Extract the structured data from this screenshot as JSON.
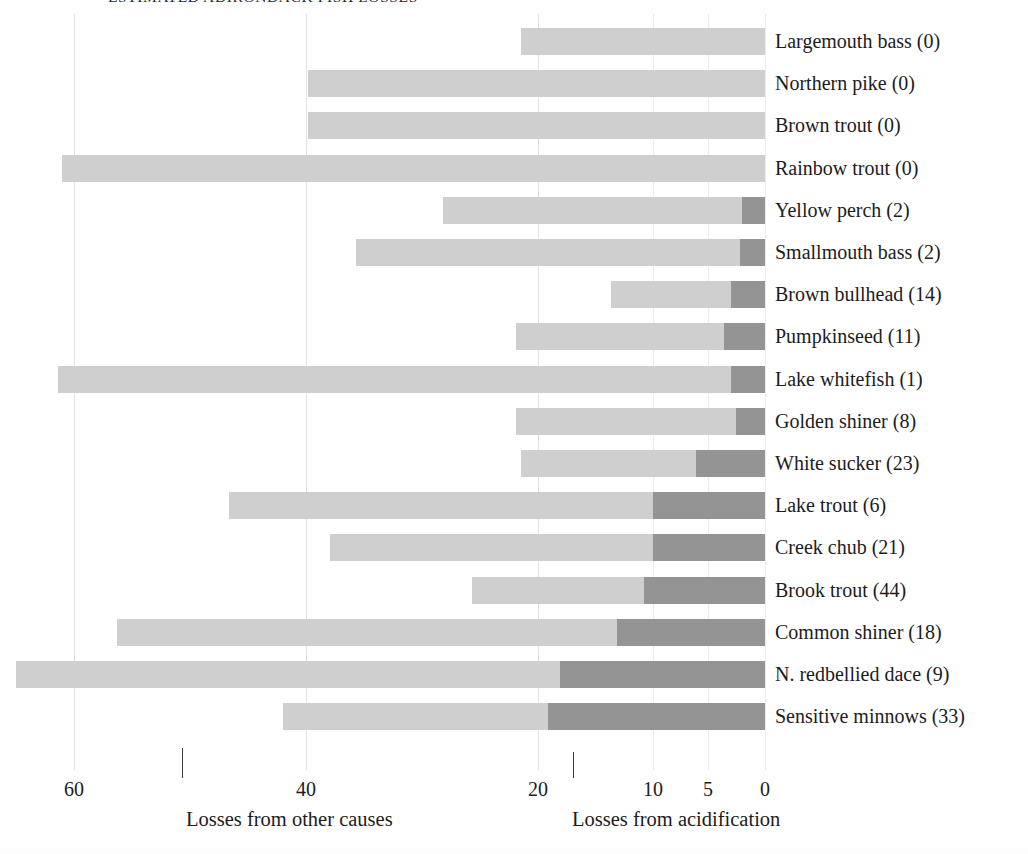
{
  "chart": {
    "title": "ESTIMATED ADIRONDACK FISH LOSSES",
    "axis": {
      "left_caption": "Losses from other causes",
      "right_caption": "Losses from acidification",
      "ticks": [
        "60",
        "40",
        "20",
        "10",
        "5",
        "0"
      ]
    }
  },
  "chart_data": {
    "type": "bar",
    "title": "ESTIMATED ADIRONDACK FISH LOSSES",
    "orientation": "horizontal",
    "stacked": true,
    "xlabel": "Number of ponds with lost populations",
    "ylabel": "",
    "grid": true,
    "legend_position": "below-axis",
    "x_axis_note": "Axis runs right-to-left from 0 at the right edge to 60 at the left; scale is non-linear (expanded near 0).",
    "axis_ticks": [
      60,
      40,
      20,
      10,
      5,
      0
    ],
    "series": [
      {
        "name": "Losses from acidification",
        "color": "#949494"
      },
      {
        "name": "Losses from other causes",
        "color": "#cfcfcf"
      }
    ],
    "categories": [
      "Largemouth bass",
      "Northern pike",
      "Brown trout",
      "Rainbow trout",
      "Yellow perch",
      "Smallmouth bass",
      "Brown bullhead",
      "Pumpkinseed",
      "Lake whitefish",
      "Golden shiner",
      "White sucker",
      "Lake trout",
      "Creek chub",
      "Brook trout",
      "Common shiner",
      "N. redbellied dace",
      "Sensitive minnows"
    ],
    "acidification_values": [
      0,
      0,
      0,
      0,
      2,
      2,
      14,
      11,
      1,
      8,
      23,
      6,
      21,
      44,
      18,
      9,
      33
    ],
    "rows": [
      {
        "label": "Largemouth bass (0)",
        "name": "Largemouth bass",
        "acidification": 0,
        "total_start_px": 521,
        "split_px": 765
      },
      {
        "label": "Northern pike (0)",
        "name": "Northern pike",
        "acidification": 0,
        "total_start_px": 308,
        "split_px": 765
      },
      {
        "label": "Brown trout (0)",
        "name": "Brown trout",
        "acidification": 0,
        "total_start_px": 308,
        "split_px": 765
      },
      {
        "label": "Rainbow trout (0)",
        "name": "Rainbow trout",
        "acidification": 0,
        "total_start_px": 62,
        "split_px": 765
      },
      {
        "label": "Yellow perch (2)",
        "name": "Yellow perch",
        "acidification": 2,
        "total_start_px": 443,
        "split_px": 742
      },
      {
        "label": "Smallmouth bass (2)",
        "name": "Smallmouth bass",
        "acidification": 2,
        "total_start_px": 356,
        "split_px": 740
      },
      {
        "label": "Brown bullhead (14)",
        "name": "Brown bullhead",
        "acidification": 14,
        "total_start_px": 611,
        "split_px": 731
      },
      {
        "label": "Pumpkinseed (11)",
        "name": "Pumpkinseed",
        "acidification": 11,
        "total_start_px": 516,
        "split_px": 724
      },
      {
        "label": "Lake whitefish (1)",
        "name": "Lake whitefish",
        "acidification": 1,
        "total_start_px": 58,
        "split_px": 731
      },
      {
        "label": "Golden shiner (8)",
        "name": "Golden shiner",
        "acidification": 8,
        "total_start_px": 516,
        "split_px": 736
      },
      {
        "label": "White sucker (23)",
        "name": "White sucker",
        "acidification": 23,
        "total_start_px": 521,
        "split_px": 696
      },
      {
        "label": "Lake trout (6)",
        "name": "Lake trout",
        "acidification": 6,
        "total_start_px": 229,
        "split_px": 653
      },
      {
        "label": "Creek chub (21)",
        "name": "Creek chub",
        "acidification": 21,
        "total_start_px": 330,
        "split_px": 653
      },
      {
        "label": "Brook trout (44)",
        "name": "Brook trout",
        "acidification": 44,
        "total_start_px": 472,
        "split_px": 644
      },
      {
        "label": "Common shiner (18)",
        "name": "Common shiner",
        "acidification": 18,
        "total_start_px": 117,
        "split_px": 617
      },
      {
        "label": "N. redbellied dace (9)",
        "name": "N. redbellied dace",
        "acidification": 9,
        "total_start_px": 16,
        "split_px": 560
      },
      {
        "label": "Sensitive minnows (33)",
        "name": "Sensitive minnows",
        "acidification": 33,
        "total_start_px": 283,
        "split_px": 548
      }
    ],
    "tick_positions_px": [
      {
        "value": "60",
        "x": 74
      },
      {
        "value": "40",
        "x": 306
      },
      {
        "value": "20",
        "x": 538
      },
      {
        "value": "10",
        "x": 653
      },
      {
        "value": "5",
        "x": 708
      },
      {
        "value": "0",
        "x": 765
      }
    ],
    "gridlines_px": [
      74,
      306,
      538,
      653,
      708,
      765
    ],
    "colors": {
      "acidification": "#949494",
      "other_causes": "#cfcfcf",
      "gridline": "#e2e2e2",
      "text": "#1c1c1c"
    }
  }
}
